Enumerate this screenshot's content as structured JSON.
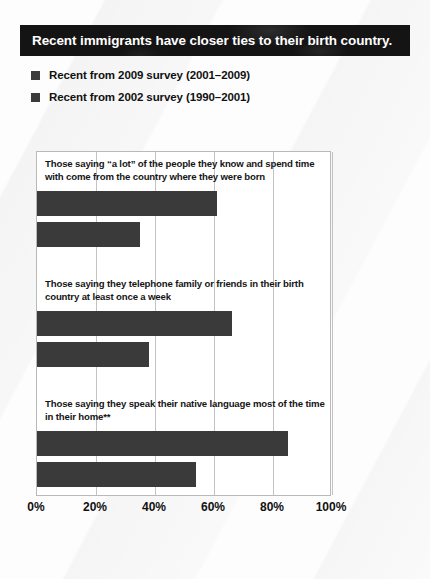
{
  "title": "Recent immigrants have closer ties to their birth country.",
  "legend": [
    {
      "label": "Recent from 2009 survey (2001–2009)",
      "color": "#3b3b3b"
    },
    {
      "label": "Recent from 2002 survey (1990–2001)",
      "color": "#3b3b3b"
    }
  ],
  "chart_data": {
    "type": "bar",
    "orientation": "horizontal",
    "title": "Recent immigrants have closer ties to their birth country.",
    "xlabel": "",
    "ylabel": "",
    "xlim": [
      0,
      100
    ],
    "grid": true,
    "legend_position": "above-plot",
    "tick_labels": [
      "0%",
      "20%",
      "40%",
      "60%",
      "80%",
      "100%"
    ],
    "tick_values": [
      0,
      20,
      40,
      60,
      80,
      100
    ],
    "categories": [
      "Those saying “a lot” of the people they know and spend time with come from the country where they were born",
      "Those saying they telephone family or friends in their birth country at least once a week",
      "Those saying they speak their native language most of the time in their home**"
    ],
    "series": [
      {
        "name": "Recent from 2009 survey (2001–2009)",
        "color": "#3a3a3a",
        "values": [
          61,
          66,
          85
        ]
      },
      {
        "name": "Recent from 2002 survey (1990–2001)",
        "color": "#3a3a3a",
        "values": [
          35,
          38,
          54
        ]
      }
    ]
  }
}
